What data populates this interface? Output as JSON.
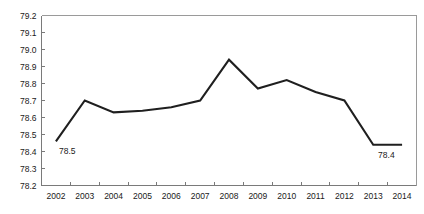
{
  "chart_data": {
    "type": "line",
    "title": "",
    "xlabel": "",
    "ylabel": "",
    "categories": [
      "2002",
      "2003",
      "2004",
      "2005",
      "2006",
      "2007",
      "2008",
      "2009",
      "2010",
      "2011",
      "2012",
      "2013",
      "2014"
    ],
    "values": [
      78.46,
      78.7,
      78.63,
      78.64,
      78.66,
      78.7,
      78.94,
      78.77,
      78.82,
      78.75,
      78.7,
      78.44,
      78.44
    ],
    "series": [
      {
        "name": "value",
        "values": [
          78.46,
          78.7,
          78.63,
          78.64,
          78.66,
          78.7,
          78.94,
          78.77,
          78.82,
          78.75,
          78.7,
          78.44,
          78.44
        ],
        "color": "#1f1f1f"
      }
    ],
    "ylim": [
      78.2,
      79.2
    ],
    "ytick_labels": [
      "79.2",
      "79.1",
      "79.0",
      "78.9",
      "78.8",
      "78.7",
      "78.6",
      "78.5",
      "78.4",
      "78.3",
      "78.2"
    ],
    "ytick_values": [
      79.2,
      79.1,
      79.0,
      78.9,
      78.8,
      78.7,
      78.6,
      78.5,
      78.4,
      78.3,
      78.2
    ],
    "xtick_labels": [
      "2002",
      "2003",
      "2004",
      "2005",
      "2006",
      "2007",
      "2008",
      "2009",
      "2010",
      "2011",
      "2012",
      "2013",
      "2014"
    ],
    "grid": false,
    "legend": false,
    "legend_position": "none",
    "annotations": [
      {
        "text": "78.5",
        "category": "2002",
        "value": 78.46,
        "placement": "below-right"
      },
      {
        "text": "78.4",
        "category": "2014",
        "value": 78.44,
        "placement": "below-left"
      }
    ],
    "line_color": "#1f1f1f",
    "background_color": "#ffffff",
    "axis_color": "#7a7a7a"
  }
}
